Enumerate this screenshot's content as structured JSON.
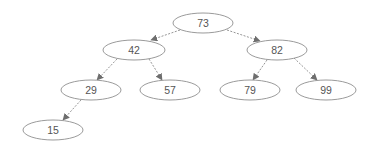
{
  "diagram": {
    "type": "binary-search-tree",
    "colors": {
      "background": "#ffffff",
      "node_stroke": "#8f8f8f",
      "edge": "#8a8a8a",
      "arrow": "#6e6e6e",
      "text": "#555555"
    },
    "nodes": [
      {
        "id": "n73",
        "label": "73",
        "cx": 203,
        "cy": 23
      },
      {
        "id": "n42",
        "label": "42",
        "cx": 134,
        "cy": 50
      },
      {
        "id": "n82",
        "label": "82",
        "cx": 277,
        "cy": 50
      },
      {
        "id": "n29",
        "label": "29",
        "cx": 91,
        "cy": 90
      },
      {
        "id": "n57",
        "label": "57",
        "cx": 170,
        "cy": 90
      },
      {
        "id": "n79",
        "label": "79",
        "cx": 250,
        "cy": 90
      },
      {
        "id": "n99",
        "label": "99",
        "cx": 326,
        "cy": 90
      },
      {
        "id": "n15",
        "label": "15",
        "cx": 53,
        "cy": 130
      }
    ],
    "edges": [
      {
        "from": "73",
        "to": "42"
      },
      {
        "from": "73",
        "to": "82"
      },
      {
        "from": "42",
        "to": "29"
      },
      {
        "from": "42",
        "to": "57"
      },
      {
        "from": "82",
        "to": "79"
      },
      {
        "from": "82",
        "to": "99"
      },
      {
        "from": "29",
        "to": "15"
      }
    ]
  }
}
